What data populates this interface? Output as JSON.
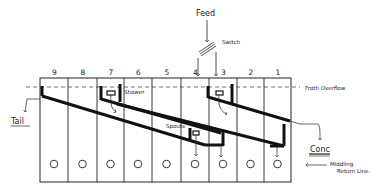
{
  "feed": {
    "label": "Feed"
  },
  "switch": {
    "label": "Switch"
  },
  "froth_overflow": {
    "label": "Froth Overflow"
  },
  "cells": {
    "numbers": [
      "9",
      "8",
      "7",
      "6",
      "5",
      "4",
      "3",
      "2",
      "1"
    ],
    "count": 9
  },
  "labels": {
    "tail": "Tail",
    "conc": "Conc",
    "shower": "Shower",
    "spouts": "Spouts",
    "middling_return_line": [
      "Middling",
      "Return Line."
    ]
  },
  "colors": {
    "ink": "#111111",
    "paper": "#ffffff"
  }
}
